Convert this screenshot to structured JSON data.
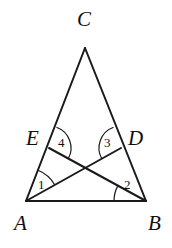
{
  "figure": {
    "name": "triangle-with-two-cevians",
    "background_color": "#ffffff",
    "stroke_color": "#1a1a1a",
    "arc_color": "#1a1a1a",
    "stroke_width": 2,
    "arc_width": 1.2
  },
  "points": {
    "A": {
      "label": "A",
      "x": 26,
      "y": 201,
      "label_x": 14,
      "label_y": 213
    },
    "B": {
      "label": "B",
      "x": 146,
      "y": 201,
      "label_x": 148,
      "label_y": 213
    },
    "C": {
      "label": "C",
      "x": 85,
      "y": 48,
      "label_x": 77,
      "label_y": 9
    },
    "D": {
      "label": "D",
      "x": 121,
      "y": 148,
      "label_x": 128,
      "label_y": 128
    },
    "E": {
      "label": "E",
      "x": 49,
      "y": 148,
      "label_x": 26,
      "label_y": 128
    },
    "P": {
      "label": "",
      "x": 85,
      "y": 170
    }
  },
  "segments": [
    {
      "name": "side-AC",
      "from": "A",
      "to": "C"
    },
    {
      "name": "side-BC",
      "from": "B",
      "to": "C"
    },
    {
      "name": "side-AB",
      "from": "A",
      "to": "B"
    },
    {
      "name": "cevian-AD",
      "from": "A",
      "to": "D"
    },
    {
      "name": "cevian-BE",
      "from": "B",
      "to": "E"
    }
  ],
  "angles": [
    {
      "id": "1",
      "label": "1",
      "vertex": "A",
      "between": [
        "AC",
        "AD"
      ],
      "radius": 33,
      "label_x": 38,
      "label_y": 178
    },
    {
      "id": "2",
      "label": "2",
      "vertex": "B",
      "between": [
        "BE",
        "BA"
      ],
      "radius": 32,
      "label_x": 124,
      "label_y": 178
    },
    {
      "id": "3",
      "label": "3",
      "vertex": "D",
      "between": [
        "DC",
        "DA"
      ],
      "radius": 22,
      "label_x": 104,
      "label_y": 136
    },
    {
      "id": "4",
      "label": "4",
      "vertex": "E",
      "between": [
        "EB",
        "EC"
      ],
      "radius": 22,
      "label_x": 58,
      "label_y": 136
    }
  ]
}
